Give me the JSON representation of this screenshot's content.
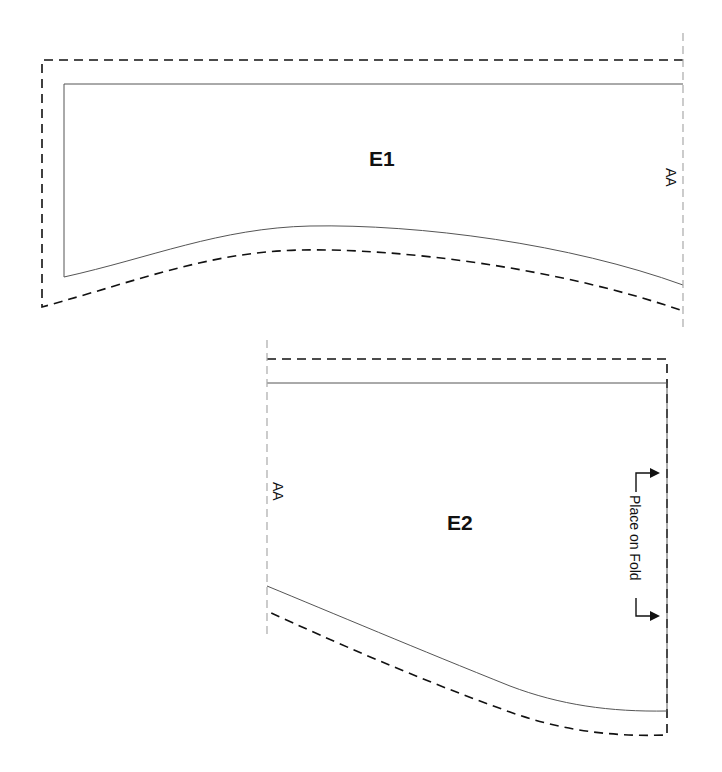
{
  "pieces": [
    {
      "id": "E1",
      "label": "E1",
      "match_label": "AA"
    },
    {
      "id": "E2",
      "label": "E2",
      "match_label": "AA",
      "fold_instruction": "Place on Fold"
    }
  ],
  "colors": {
    "background": "#ffffff",
    "cut_line": "#111111",
    "sew_line": "#555555",
    "match_line": "#aaaaaa"
  }
}
